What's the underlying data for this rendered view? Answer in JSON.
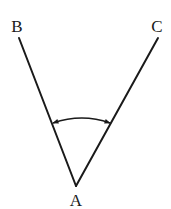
{
  "diagram": {
    "type": "angle",
    "points": {
      "A": {
        "label": "A",
        "x": 76,
        "y": 186,
        "label_x": 76,
        "label_y": 200
      },
      "B": {
        "label": "B",
        "x": 19,
        "y": 38,
        "label_x": 17,
        "label_y": 26
      },
      "C": {
        "label": "C",
        "x": 158,
        "y": 38,
        "label_x": 157,
        "label_y": 26
      }
    },
    "segments": [
      {
        "from": "A",
        "to": "B"
      },
      {
        "from": "A",
        "to": "C"
      }
    ],
    "angle_marker": {
      "vertex": "A",
      "between": [
        "B",
        "C"
      ],
      "style": "double-headed-arc",
      "start": {
        "x": 53,
        "y": 123
      },
      "end": {
        "x": 110,
        "y": 123
      },
      "control": {
        "x": 82,
        "y": 113
      }
    },
    "colors": {
      "stroke": "#1a1a1a",
      "background": "#ffffff"
    }
  }
}
